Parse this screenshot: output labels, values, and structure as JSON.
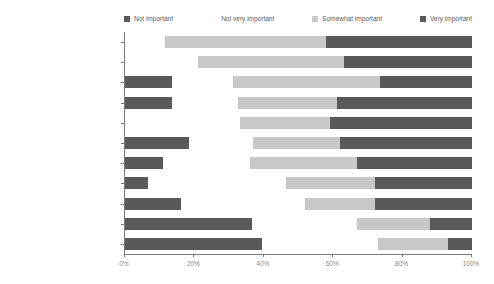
{
  "chart_data": {
    "type": "bar",
    "subtype": "stacked-horizontal-100pct",
    "title": "",
    "xlabel": "",
    "ylabel": "",
    "xlim": [
      0,
      100
    ],
    "xticks": [
      "0%",
      "20%",
      "40%",
      "60%",
      "80%",
      "100%"
    ],
    "xtick_values": [
      0,
      20,
      40,
      60,
      80,
      100
    ],
    "grid": false,
    "legend_position": "top",
    "orientation": "horizontal",
    "categories": [
      "Mobile phone-based access",
      "Vendor support",
      "Web-based access",
      "Secure access",
      "Spam filtering",
      "Email storage",
      "Ease of setup",
      "Low cost",
      "Easy to use",
      "Brand",
      "Customize interface"
    ],
    "series": [
      {
        "name": "Not important",
        "color": "#595959",
        "values": [
          0,
          0,
          13.5,
          13.5,
          0,
          18.5,
          11,
          6.5,
          16,
          36.5,
          39.5
        ]
      },
      {
        "name": "Not very important",
        "color": "#ffffff",
        "values": [
          11.5,
          21,
          17.5,
          19,
          33,
          18.5,
          25,
          40,
          36,
          30.5,
          33.5
        ]
      },
      {
        "name": "Somewhat important",
        "color": "#c8c8c8",
        "values": [
          46.5,
          42,
          42.5,
          28.5,
          26,
          25,
          31,
          25.5,
          20,
          21,
          20
        ]
      },
      {
        "name": "Very important",
        "color": "#595959",
        "values": [
          42,
          37,
          26.5,
          39,
          41,
          38,
          33,
          28,
          28,
          12,
          7
        ]
      }
    ]
  },
  "legend": {
    "items": [
      {
        "label": "Not important",
        "swatch": "#595959"
      },
      {
        "label": "Not very important",
        "swatch": "#ffffff"
      },
      {
        "label": "Somewhat important",
        "swatch": "#c8c8c8"
      },
      {
        "label": "Very important",
        "swatch": "#595959"
      }
    ]
  }
}
